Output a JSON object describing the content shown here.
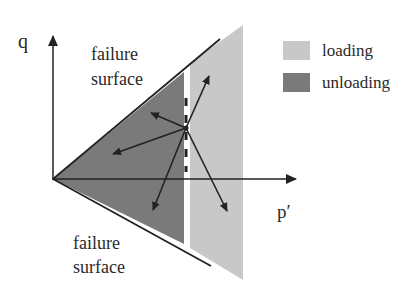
{
  "axes": {
    "y_label": "q",
    "x_label": "p′"
  },
  "annotations": {
    "upper_failure_line1": "failure",
    "upper_failure_line2": "surface",
    "lower_failure_line1": "failure",
    "lower_failure_line2": "surface"
  },
  "legend": {
    "items": [
      {
        "label": "loading",
        "color": "#c8c8c8"
      },
      {
        "label": "unloading",
        "color": "#7a7a7a"
      }
    ]
  },
  "colors": {
    "loading_region": "#c8c8c8",
    "unloading_region": "#7a7a7a",
    "line": "#222222"
  },
  "stress_vectors": {
    "count": 6,
    "description": "stress increment directions from current stress state"
  }
}
